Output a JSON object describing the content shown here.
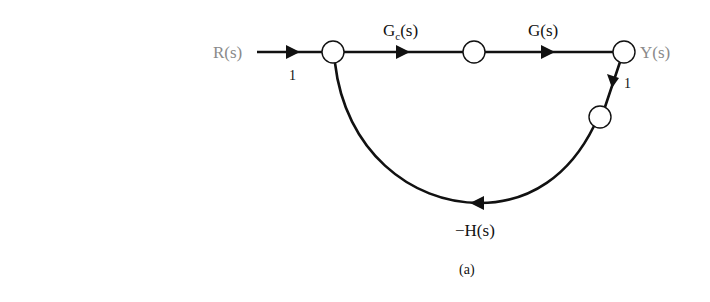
{
  "diagram": {
    "type": "signal-flow-graph",
    "caption": "(a)",
    "input_label": "R(s)",
    "output_label": "Y(s)",
    "nodes": [
      {
        "id": "n1",
        "x": 333,
        "y": 52
      },
      {
        "id": "n2",
        "x": 474,
        "y": 52
      },
      {
        "id": "n3",
        "x": 624,
        "y": 52
      },
      {
        "id": "n4",
        "x": 600,
        "y": 117
      }
    ],
    "edges": [
      {
        "id": "input",
        "from": "R(s)",
        "to": "n1",
        "gain": "1"
      },
      {
        "id": "controller",
        "from": "n1",
        "to": "n2",
        "gain_main": "G",
        "gain_sub": "c",
        "gain_tail": "(s)"
      },
      {
        "id": "plant",
        "from": "n2",
        "to": "n3",
        "gain": "G(s)"
      },
      {
        "id": "output-tap",
        "from": "n3",
        "to": "n4",
        "gain": "1"
      },
      {
        "id": "feedback",
        "from": "n4",
        "to": "n1",
        "gain": "−H(s)"
      }
    ],
    "colors": {
      "line": "#111111",
      "io_label": "#8a8a8a",
      "background": "#ffffff"
    }
  }
}
